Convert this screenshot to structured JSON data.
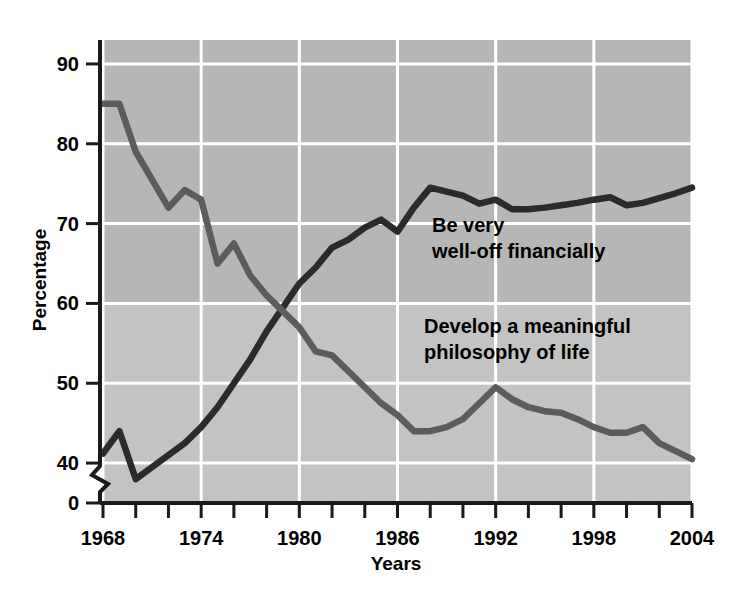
{
  "chart_data": {
    "type": "line",
    "title": "",
    "xlabel": "Years",
    "ylabel": "Percentage",
    "xlim": [
      1968,
      2004
    ],
    "ylim": [
      35,
      93
    ],
    "grid": true,
    "y_axis_break": true,
    "y_axis_break_label": "0",
    "y_ticks": [
      40,
      50,
      60,
      70,
      80,
      90
    ],
    "y_tick_labels": [
      "40",
      "50",
      "60",
      "70",
      "80",
      "90"
    ],
    "x_ticks": [
      1968,
      1970,
      1972,
      1974,
      1976,
      1978,
      1980,
      1982,
      1984,
      1986,
      1988,
      1990,
      1992,
      1994,
      1996,
      1998,
      2000,
      2002,
      2004
    ],
    "x_tick_labels_shown": [
      "1968",
      "1974",
      "1980",
      "1986",
      "1992",
      "1998",
      "2004"
    ],
    "x_gridlines": [
      1968,
      1974,
      1980,
      1986,
      1992,
      1998,
      2004
    ],
    "legend_position": "inline-annotation",
    "colors": {
      "financial": "#2b2b2b",
      "philosophy": "#5c5c5c",
      "plot_background_upper": "#b6b6b6",
      "plot_background_lower": "#c3c3c3",
      "gridline": "#ffffff",
      "axis": "#1a1a1a",
      "page_background": "#ffffff"
    },
    "series": [
      {
        "name": "Be very well-off financially",
        "color": "#2b2b2b",
        "label_lines": [
          "Be very",
          "well-off financially"
        ],
        "x": [
          1968,
          1969,
          1970,
          1971,
          1972,
          1973,
          1974,
          1975,
          1976,
          1977,
          1978,
          1979,
          1980,
          1981,
          1982,
          1983,
          1984,
          1985,
          1986,
          1987,
          1988,
          1989,
          1990,
          1991,
          1992,
          1993,
          1994,
          1995,
          1996,
          1997,
          1998,
          1999,
          2000,
          2001,
          2002,
          2003,
          2004
        ],
        "values": [
          41.2,
          44.0,
          38.0,
          39.5,
          41.0,
          42.5,
          44.5,
          47.0,
          50.0,
          53.0,
          56.5,
          59.5,
          62.5,
          64.5,
          67.0,
          68.0,
          69.5,
          70.5,
          69.0,
          72.0,
          74.5,
          74.0,
          73.5,
          72.5,
          73.0,
          71.8,
          71.8,
          72.0,
          72.3,
          72.6,
          73.0,
          73.3,
          72.3,
          72.6,
          73.2,
          73.8,
          74.5
        ]
      },
      {
        "name": "Develop a meaningful philosophy of life",
        "color": "#5c5c5c",
        "label_lines": [
          "Develop a meaningful",
          "philosophy of life"
        ],
        "x": [
          1968,
          1969,
          1970,
          1971,
          1972,
          1973,
          1974,
          1975,
          1976,
          1977,
          1978,
          1979,
          1980,
          1981,
          1982,
          1983,
          1984,
          1985,
          1986,
          1987,
          1988,
          1989,
          1990,
          1991,
          1992,
          1993,
          1994,
          1995,
          1996,
          1997,
          1998,
          1999,
          2000,
          2001,
          2002,
          2003,
          2004
        ],
        "values": [
          85.0,
          85.0,
          79.0,
          75.5,
          72.0,
          74.2,
          73.0,
          65.0,
          67.5,
          63.5,
          61.0,
          59.0,
          57.0,
          54.0,
          53.5,
          51.5,
          49.5,
          47.5,
          46.0,
          44.0,
          44.0,
          44.5,
          45.5,
          47.5,
          49.5,
          48.0,
          47.0,
          46.5,
          46.3,
          45.5,
          44.5,
          43.8,
          43.8,
          44.5,
          42.5,
          41.5,
          40.5
        ]
      }
    ]
  },
  "figure": {
    "y_axis_title": "Percentage",
    "x_axis_title": "Years"
  }
}
